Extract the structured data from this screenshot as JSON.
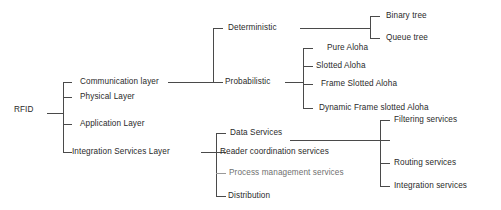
{
  "diagram": {
    "type": "tree-taxonomy",
    "line_color": "#4a4a4a",
    "text_color": "#2a2a2a",
    "background": "#ffffff",
    "root": {
      "label": "RFID"
    },
    "level1": [
      {
        "label": "Communication layer"
      },
      {
        "label": "Physical Layer"
      },
      {
        "label": "Application Layer"
      },
      {
        "label": "Integration Services Layer"
      }
    ],
    "communication_children": [
      {
        "label": "Deterministic"
      },
      {
        "label": "Probabilistic"
      }
    ],
    "deterministic_children": [
      {
        "label": "Binary tree"
      },
      {
        "label": "Queue tree"
      }
    ],
    "probabilistic_children": [
      {
        "label": "Pure Aloha"
      },
      {
        "label": "Slotted Aloha"
      },
      {
        "label": "Frame Slotted Aloha"
      },
      {
        "label": "Dynamic Frame slotted Aloha"
      }
    ],
    "integration_children": [
      {
        "label": "Data Services"
      },
      {
        "label": "Reader coordination services"
      },
      {
        "label": "Process management services"
      },
      {
        "label": "Distribution"
      }
    ],
    "data_services_children": [
      {
        "label": "Filtering services"
      },
      {
        "label": ""
      },
      {
        "label": "Routing services"
      },
      {
        "label": "Integration services"
      }
    ]
  }
}
